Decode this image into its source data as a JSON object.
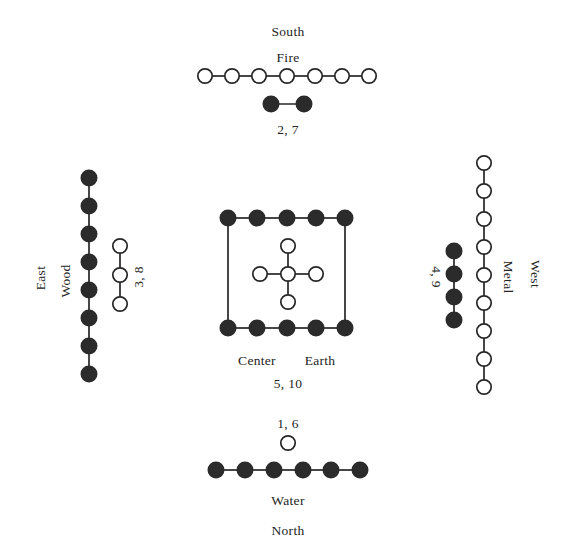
{
  "diagram": {
    "title_visible": false,
    "width": 574,
    "height": 560,
    "node_radius": 7.2,
    "colors": {
      "yang_fill": "#ffffff",
      "yin_fill": "#2b2b2b",
      "stroke": "#262626",
      "background": "#ffffff",
      "text": "#242424"
    }
  },
  "labels": {
    "south": "South",
    "fire": "Fire",
    "fire_numbers": "2, 7",
    "east": "East",
    "wood": "Wood",
    "wood_numbers": "3, 8",
    "west": "West",
    "metal": "Metal",
    "metal_numbers": "4, 9",
    "center": "Center",
    "earth": "Earth",
    "earth_numbers": "5, 10",
    "water_numbers": "1, 6",
    "water": "Water",
    "north": "North"
  },
  "groups": {
    "south_fire": {
      "direction": "South",
      "element": "Fire",
      "numbers": "2, 7",
      "yang_count": 7,
      "yin_count": 2,
      "yang_orientation": "horizontal",
      "yin_orientation": "horizontal",
      "yang_nodes": [
        {
          "x": 205,
          "y": 76
        },
        {
          "x": 232,
          "y": 76
        },
        {
          "x": 259,
          "y": 76
        },
        {
          "x": 287,
          "y": 76
        },
        {
          "x": 315,
          "y": 76
        },
        {
          "x": 342,
          "y": 76
        },
        {
          "x": 369,
          "y": 76
        }
      ],
      "yin_nodes": [
        {
          "x": 271,
          "y": 104
        },
        {
          "x": 304,
          "y": 104
        }
      ]
    },
    "east_wood": {
      "direction": "East",
      "element": "Wood",
      "numbers": "3, 8",
      "yin_count": 8,
      "yang_count": 3,
      "yin_orientation": "vertical",
      "yang_orientation": "vertical",
      "yin_nodes": [
        {
          "x": 89,
          "y": 178
        },
        {
          "x": 89,
          "y": 206
        },
        {
          "x": 89,
          "y": 234
        },
        {
          "x": 89,
          "y": 262
        },
        {
          "x": 89,
          "y": 290
        },
        {
          "x": 89,
          "y": 318
        },
        {
          "x": 89,
          "y": 346
        },
        {
          "x": 89,
          "y": 374
        }
      ],
      "yang_nodes": [
        {
          "x": 120,
          "y": 246
        },
        {
          "x": 120,
          "y": 275
        },
        {
          "x": 120,
          "y": 304
        }
      ]
    },
    "west_metal": {
      "direction": "West",
      "element": "Metal",
      "numbers": "4, 9",
      "yang_count": 9,
      "yin_count": 4,
      "yang_orientation": "vertical",
      "yin_orientation": "vertical",
      "yang_nodes": [
        {
          "x": 484,
          "y": 163
        },
        {
          "x": 484,
          "y": 191
        },
        {
          "x": 484,
          "y": 219
        },
        {
          "x": 484,
          "y": 247
        },
        {
          "x": 484,
          "y": 275
        },
        {
          "x": 484,
          "y": 303
        },
        {
          "x": 484,
          "y": 331
        },
        {
          "x": 484,
          "y": 359
        },
        {
          "x": 484,
          "y": 387
        }
      ],
      "yin_nodes": [
        {
          "x": 454,
          "y": 251
        },
        {
          "x": 454,
          "y": 274
        },
        {
          "x": 454,
          "y": 297
        },
        {
          "x": 454,
          "y": 320
        }
      ]
    },
    "center_earth": {
      "direction": "Center",
      "element": "Earth",
      "numbers": "5, 10",
      "yin_count": 10,
      "yang_count": 5,
      "yin_shape": "square-outline",
      "yang_shape": "cross",
      "yin_nodes": [
        {
          "x": 228,
          "y": 218
        },
        {
          "x": 257,
          "y": 218
        },
        {
          "x": 287,
          "y": 218
        },
        {
          "x": 316,
          "y": 218
        },
        {
          "x": 345,
          "y": 218
        },
        {
          "x": 228,
          "y": 328
        },
        {
          "x": 257,
          "y": 328
        },
        {
          "x": 287,
          "y": 328
        },
        {
          "x": 316,
          "y": 328
        },
        {
          "x": 345,
          "y": 328
        }
      ],
      "yang_nodes": [
        {
          "x": 288,
          "y": 246
        },
        {
          "x": 260,
          "y": 274
        },
        {
          "x": 288,
          "y": 274
        },
        {
          "x": 316,
          "y": 274
        },
        {
          "x": 288,
          "y": 302
        }
      ]
    },
    "north_water": {
      "direction": "North",
      "element": "Water",
      "numbers": "1, 6",
      "yang_count": 1,
      "yin_count": 6,
      "yin_orientation": "horizontal",
      "yang_nodes": [
        {
          "x": 288,
          "y": 443
        }
      ],
      "yin_nodes": [
        {
          "x": 216,
          "y": 470
        },
        {
          "x": 245,
          "y": 470
        },
        {
          "x": 274,
          "y": 470
        },
        {
          "x": 303,
          "y": 470
        },
        {
          "x": 331,
          "y": 470
        },
        {
          "x": 360,
          "y": 470
        }
      ]
    }
  },
  "label_positions": {
    "south": {
      "x": 288,
      "y": 32,
      "rot": 0
    },
    "fire": {
      "x": 288,
      "y": 58,
      "rot": 0
    },
    "fire_numbers": {
      "x": 288,
      "y": 130,
      "rot": 0
    },
    "east": {
      "x": 41,
      "y": 278,
      "rot": -90
    },
    "wood": {
      "x": 66,
      "y": 281,
      "rot": -90
    },
    "wood_numbers": {
      "x": 139,
      "y": 277,
      "rot": -90
    },
    "west": {
      "x": 535,
      "y": 274,
      "rot": 90
    },
    "metal": {
      "x": 508,
      "y": 277,
      "rot": 90
    },
    "metal_numbers": {
      "x": 436,
      "y": 277,
      "rot": 90
    },
    "center": {
      "x": 257,
      "y": 361,
      "rot": 0
    },
    "earth": {
      "x": 320,
      "y": 361,
      "rot": 0
    },
    "earth_numbers": {
      "x": 288,
      "y": 384,
      "rot": 0
    },
    "water_numbers": {
      "x": 288,
      "y": 424,
      "rot": 0
    },
    "water": {
      "x": 288,
      "y": 501,
      "rot": 0
    },
    "north": {
      "x": 288,
      "y": 531,
      "rot": 0
    }
  }
}
